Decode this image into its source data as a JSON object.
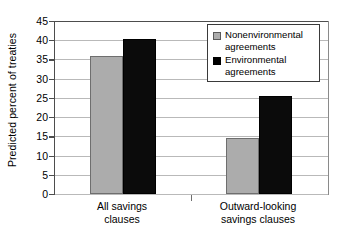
{
  "chart_data": {
    "type": "bar",
    "title": "",
    "xlabel": "",
    "ylabel": "Predicted percent of treaties",
    "ylim": [
      0,
      45
    ],
    "ytick_step": 5,
    "grid": true,
    "legend_position": "top-right",
    "categories": [
      "All savings clauses",
      "Outward-looking savings clauses"
    ],
    "category_lines": [
      [
        "All savings",
        "clauses"
      ],
      [
        "Outward-looking",
        "savings clauses"
      ]
    ],
    "series": [
      {
        "name": "Nonenvironmental agreements",
        "name_lines": [
          "Nonenvironmental",
          "agreements"
        ],
        "color": "#ACACAC",
        "values": [
          36,
          14.5
        ]
      },
      {
        "name": "Environmental agreements",
        "name_lines": [
          "Environmental",
          "agreements"
        ],
        "color": "#000000",
        "values": [
          40.3,
          25.5
        ]
      }
    ],
    "ytick_labels": [
      "45",
      "40",
      "35",
      "30",
      "25",
      "20",
      "15",
      "10",
      "5",
      "0"
    ]
  },
  "axis": {
    "y_title": "Predicted percent of treaties"
  },
  "legend": {
    "items": [
      {
        "label_line1": "Nonenvironmental",
        "label_line2": "agreements",
        "swatch": "gray-swatch-icon"
      },
      {
        "label_line1": "Environmental",
        "label_line2": "agreements",
        "swatch": "black-swatch-icon"
      }
    ]
  },
  "xaxis": {
    "groups": [
      {
        "line1": "All savings",
        "line2": "clauses"
      },
      {
        "line1": "Outward-looking",
        "line2": "savings clauses"
      }
    ]
  }
}
